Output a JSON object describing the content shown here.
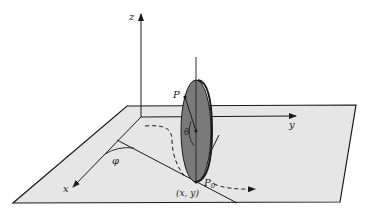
{
  "figure": {
    "labels": {
      "z_axis": "z",
      "y_axis": "y",
      "x_axis": "x",
      "point_p": "P",
      "point_p0": "P",
      "point_p0_sub": "0",
      "angle_theta": "θ",
      "angle_phi": "φ",
      "contact": "(x, y)"
    },
    "colors": {
      "plane_fill": "#e6e6e6",
      "disk_fill": "#7a7a7a",
      "line": "#1a1a1a"
    }
  }
}
